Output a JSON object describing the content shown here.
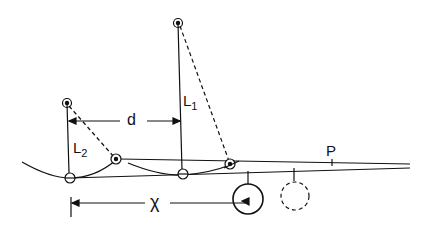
{
  "diagram": {
    "labels": {
      "L1": {
        "main": "L",
        "sub": "1"
      },
      "L2": {
        "main": "L",
        "sub": "2"
      },
      "d": "d",
      "x": "χ",
      "P": "P"
    },
    "colors": {
      "stroke": "#111111",
      "background": "#ffffff"
    },
    "elements": [
      "pendulum-L1 (solid line, top pivot)",
      "pendulum-L2 (solid line, short pivot)",
      "dashed displaced strings",
      "distance-d arrow between pendulums",
      "distance-x arrow to wheel",
      "solid wheel and dashed wheel",
      "point P on track"
    ]
  }
}
